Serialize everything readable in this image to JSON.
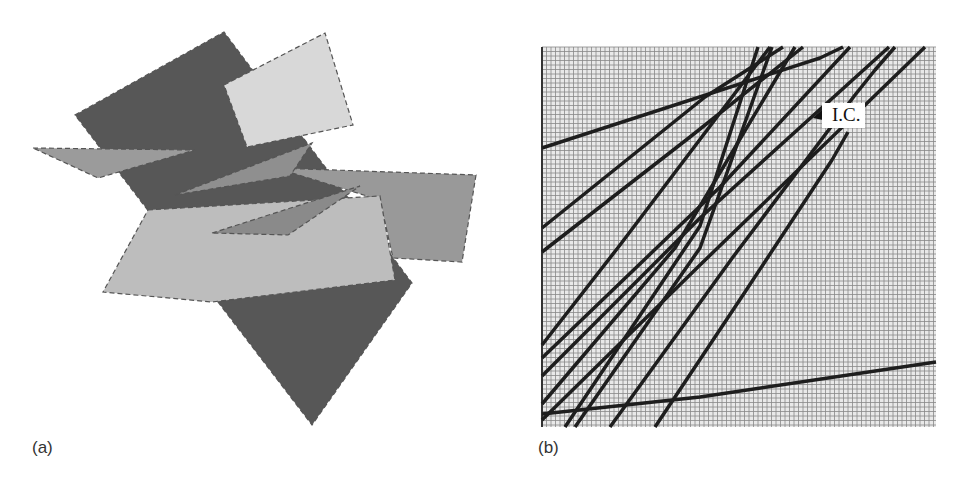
{
  "figure": {
    "panels": [
      {
        "id": "a",
        "caption": "(a)",
        "description": "3D rendering of multiple intersecting planar polygons (dark, medium and light gray) with dashed edges",
        "planes": [
          {
            "shade": "dark",
            "color": "#575757",
            "points": [
              [
                75,
                115
              ],
              [
                224,
                32
              ],
              [
                412,
                283
              ],
              [
                312,
                425
              ]
            ]
          },
          {
            "shade": "light",
            "color": "#d8d8d8",
            "points": [
              [
                224,
                85
              ],
              [
                325,
                33
              ],
              [
                353,
                125
              ],
              [
                247,
                147
              ]
            ]
          },
          {
            "shade": "medium",
            "color": "#9b9b9b",
            "points": [
              [
                33,
                148
              ],
              [
                195,
                150
              ],
              [
                98,
                178
              ]
            ]
          },
          {
            "shade": "medium",
            "color": "#999999",
            "points": [
              [
                276,
                168
              ],
              [
                476,
                175
              ],
              [
                462,
                262
              ],
              [
                393,
                258
              ],
              [
                380,
                200
              ]
            ]
          },
          {
            "shade": "light",
            "color": "#bdbdbd",
            "points": [
              [
                148,
                210
              ],
              [
                380,
                196
              ],
              [
                395,
                280
              ],
              [
                212,
                302
              ],
              [
                103,
                292
              ]
            ]
          },
          {
            "shade": "medium",
            "color": "#8f8f8f",
            "points": [
              [
                175,
                195
              ],
              [
                312,
                143
              ],
              [
                290,
                176
              ]
            ]
          },
          {
            "shade": "medium",
            "color": "#8a8a8a",
            "points": [
              [
                212,
                233
              ],
              [
                360,
                186
              ],
              [
                288,
                235
              ]
            ]
          }
        ]
      },
      {
        "id": "b",
        "caption": "(b)",
        "description": "Fine grid with stepped trajectory lines; initial condition marked",
        "annotation": {
          "label": "I.C.",
          "arrow": true
        },
        "grid": {
          "x0": 542,
          "y0": 47,
          "x1": 936,
          "y1": 427,
          "spacing": 4.5,
          "color": "#888888",
          "background": "#e9e9e9"
        },
        "lines": [
          [
            [
              542,
              148
            ],
            [
              820,
              58
            ],
            [
              843,
              47
            ]
          ],
          [
            [
              542,
              228
            ],
            [
              705,
              97
            ],
            [
              783,
              47
            ]
          ],
          [
            [
              542,
              252
            ],
            [
              690,
              137
            ],
            [
              803,
              47
            ]
          ],
          [
            [
              542,
              345
            ],
            [
              620,
              245
            ],
            [
              770,
              47
            ]
          ],
          [
            [
              542,
              358
            ],
            [
              720,
              187
            ],
            [
              850,
              47
            ]
          ],
          [
            [
              542,
              404
            ],
            [
              675,
              248
            ],
            [
              795,
              47
            ]
          ],
          [
            [
              542,
              376
            ],
            [
              700,
              218
            ],
            [
              889,
              47
            ]
          ],
          [
            [
              542,
              420
            ],
            [
              700,
              265
            ],
            [
              925,
              47
            ]
          ],
          [
            [
              565,
              427
            ],
            [
              700,
              226
            ],
            [
              758,
              47
            ]
          ],
          [
            [
              575,
              427
            ],
            [
              700,
              248
            ],
            [
              772,
              47
            ]
          ],
          [
            [
              610,
              427
            ],
            [
              733,
              257
            ],
            [
              855,
              95
            ],
            [
              875,
              70
            ],
            [
              895,
              47
            ]
          ],
          [
            [
              655,
              427
            ],
            [
              745,
              292
            ],
            [
              832,
              160
            ],
            [
              848,
              132
            ]
          ],
          [
            [
              542,
              414
            ],
            [
              700,
              397
            ],
            [
              936,
              362
            ]
          ]
        ]
      }
    ]
  }
}
